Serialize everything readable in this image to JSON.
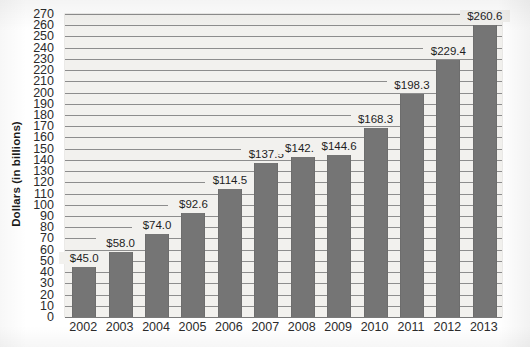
{
  "chart_data": {
    "type": "bar",
    "title": "",
    "subtitle": "",
    "xlabel": "",
    "ylabel": "Dollars (in billions)",
    "categories": [
      "2002",
      "2003",
      "2004",
      "2005",
      "2006",
      "2007",
      "2008",
      "2009",
      "2010",
      "2011",
      "2012",
      "2013"
    ],
    "values": [
      45.0,
      58.0,
      74.0,
      92.6,
      114.5,
      137.5,
      142.5,
      144.6,
      168.3,
      198.3,
      229.4,
      260.6
    ],
    "data_labels": [
      "$45.0",
      "$58.0",
      "$74.0",
      "$92.6",
      "$114.5",
      "$137.5",
      "$142.5",
      "$144.6",
      "$168.3",
      "$198.3",
      "$229.4",
      "$260.6"
    ],
    "ylim": [
      0,
      270
    ],
    "y_tick_step": 10,
    "y_tick_labels": [
      "0",
      "10",
      "20",
      "30",
      "40",
      "50",
      "60",
      "70",
      "80",
      "90",
      "100",
      "110",
      "120",
      "130",
      "140",
      "150",
      "160",
      "170",
      "180",
      "190",
      "200",
      "210",
      "220",
      "230",
      "240",
      "250",
      "260",
      "270"
    ],
    "grid": true,
    "legend": false,
    "legend_position": "none",
    "series_name": "Dollars (in billions)",
    "colors": {
      "bar": "#757575",
      "plot_background": "#f2f1ee",
      "gridline": "#8d8d8d",
      "text": "#1e1e1e",
      "page_background": "#ffffff"
    }
  }
}
